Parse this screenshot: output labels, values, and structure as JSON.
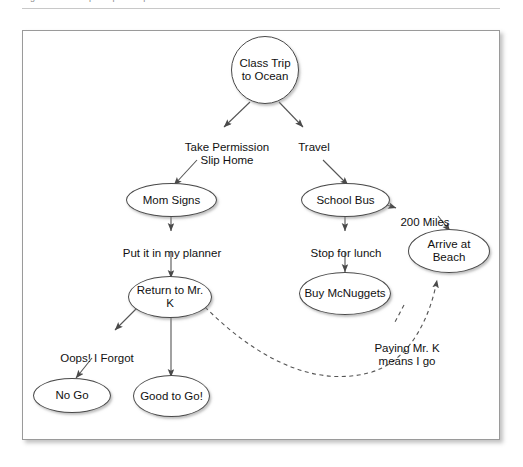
{
  "page": {
    "caption_clipped": "Figure 1. Concept map example",
    "background_color": "#ffffff",
    "frame_border_color": "#9a9a9a"
  },
  "diagram": {
    "node_stroke_color": "#4a4a4a",
    "node_fill_color": "#ffffff",
    "edge_color": "#555555",
    "nodes": [
      {
        "id": "class-trip",
        "label": "Class\nTrip to\nOcean"
      },
      {
        "id": "mom-signs",
        "label": "Mom Signs"
      },
      {
        "id": "school-bus",
        "label": "School Bus"
      },
      {
        "id": "arrive-beach",
        "label": "Arrive at\nBeach"
      },
      {
        "id": "return-mr-k",
        "label": "Return to\nMr. K"
      },
      {
        "id": "buy-mcnuggets",
        "label": "Buy\nMcNuggets"
      },
      {
        "id": "no-go",
        "label": "No Go"
      },
      {
        "id": "good-to-go",
        "label": "Good to\nGo!"
      }
    ],
    "edge_labels": [
      {
        "id": "take-permission",
        "label": "Take Permission\nSlip Home"
      },
      {
        "id": "travel",
        "label": "Travel"
      },
      {
        "id": "put-planner",
        "label": "Put it in my planner"
      },
      {
        "id": "stop-lunch",
        "label": "Stop for lunch"
      },
      {
        "id": "two-hundred-miles",
        "label": "200 Miles"
      },
      {
        "id": "oops-forgot",
        "label": "Oops! I Forgot"
      },
      {
        "id": "paying-mr-k",
        "label": "Paying Mr. K\nmeans I go"
      }
    ]
  }
}
